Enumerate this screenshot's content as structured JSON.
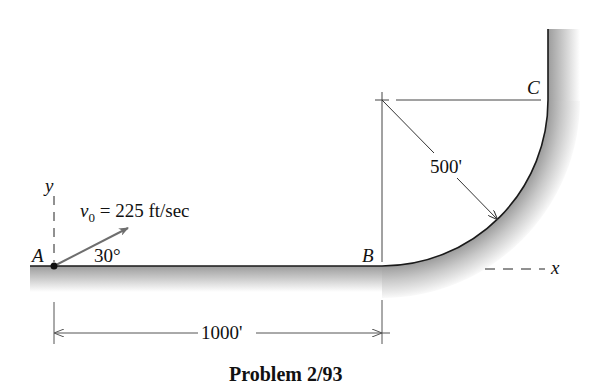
{
  "figure": {
    "caption": "Problem 2/93",
    "points": {
      "A": "A",
      "B": "B",
      "C": "C"
    },
    "axes": {
      "x": "x",
      "y": "y"
    },
    "labels": {
      "velocity_symbol": "v",
      "velocity_subscript": "0",
      "velocity_value": " = 225 ft/sec",
      "angle": "30°",
      "radius": "500'",
      "horizontal_distance": "1000'"
    },
    "values": {
      "initial_speed_ft_per_sec": 225,
      "launch_angle_deg": 30,
      "radius_ft": 500,
      "distance_AB_ft": 1000
    },
    "colors": {
      "line": "#1a1a1a",
      "velocity_arrow": "#6e6e6e",
      "ground_shade": "#b5b5b5",
      "dimension_line": "#555555"
    }
  }
}
